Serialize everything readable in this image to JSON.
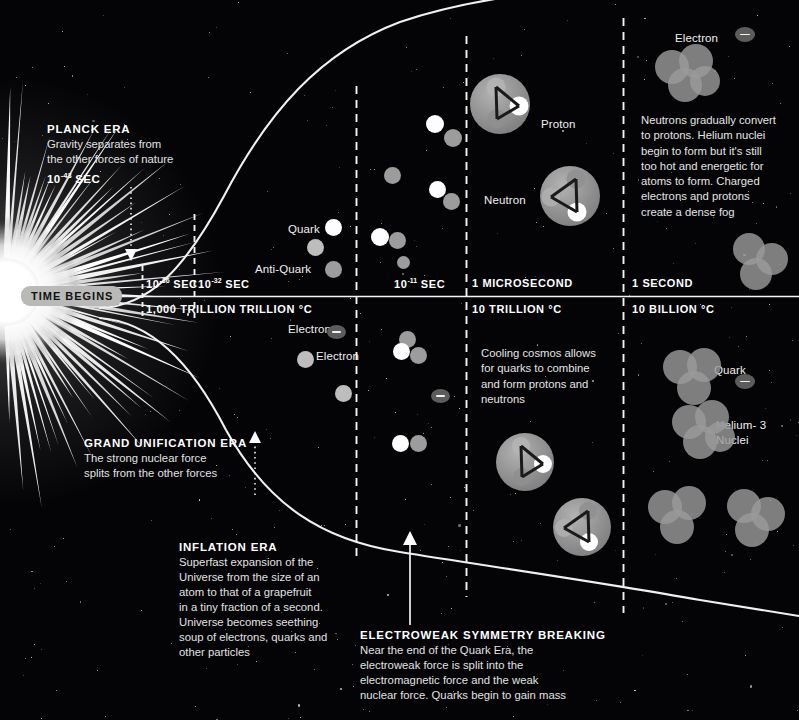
{
  "origin_label": "TIME BEGINS",
  "axis": {
    "time_ticks": [
      {
        "label": "10",
        "exponent": "-36",
        "unit": "SEC",
        "x": 146
      },
      {
        "label": "10",
        "exponent": "-32",
        "unit": "SEC",
        "x": 198
      },
      {
        "label": "10",
        "exponent": "-11",
        "unit": "SEC",
        "x": 394
      },
      {
        "label": "1",
        "exponent": "",
        "unit": "MICROSECOND",
        "x": 472
      },
      {
        "label": "1",
        "exponent": "",
        "unit": "SECOND",
        "x": 632
      }
    ],
    "temp_ticks": [
      {
        "label": "1,000 TRILLION TRILLION °C",
        "x": 146
      },
      {
        "label": "10 TRILLION °C",
        "x": 472
      },
      {
        "label": "10 BILLION °C",
        "x": 632
      }
    ]
  },
  "callouts": [
    {
      "id": "planck",
      "heading": "PLANCK ERA",
      "body": "Gravity separates from\nthe other forces of nature",
      "sub_base": "10",
      "sub_exp": "-43",
      "sub_unit": "SEC"
    },
    {
      "id": "grand-unification",
      "heading": "GRAND UNIFICATION ERA",
      "body": "The strong nuclear force\nsplits from the other forces"
    },
    {
      "id": "inflation",
      "heading": "INFLATION ERA",
      "body": "Superfast expansion of the\nUniverse from the size of an\natom to that of a grapefruit\nin a tiny fraction of a second.\nUniverse becomes seething\nsoup of electrons, quarks and\nother particles"
    },
    {
      "id": "electroweak",
      "heading": "ELECTROWEAK SYMMETRY BREAKING",
      "body": "Near the end of the Quark Era, the\nelectroweak force is split into the\nelectromagnetic force and the weak\nnuclear force. Quarks begin to gain mass"
    }
  ],
  "notes": [
    {
      "id": "neutron-conversion",
      "text": "Neutrons gradually convert\nto protons. Helium nuclei\nbegin to form but it's still\ntoo hot and energetic for\natoms to form. Charged\nelectrons  and protons\ncreate a dense fog"
    },
    {
      "id": "cooling-cosmos",
      "text": "Cooling cosmos allows\nfor quarks to combine\nand form protons and\nneutrons"
    }
  ],
  "particle_labels": [
    {
      "id": "quark-upper",
      "text": "Quark"
    },
    {
      "id": "anti-quark-upper",
      "text": "Anti-Quark"
    },
    {
      "id": "proton",
      "text": "Proton"
    },
    {
      "id": "neutron",
      "text": "Neutron"
    },
    {
      "id": "electron-upper",
      "text": "Electron"
    },
    {
      "id": "electron-lower",
      "text": "Electron"
    },
    {
      "id": "quark-lower",
      "text": "Quark"
    },
    {
      "id": "helium-3",
      "text": "Helium- 3\nNuclei"
    },
    {
      "id": "helium-4",
      "text": "Helium- 4\nNuclei"
    }
  ],
  "colors": {
    "background": "#040406",
    "curve": "#f0f0f0",
    "axis": "#f4f4f4",
    "pill_bg": "#b9b9b7",
    "quark_white": "#fdfdfd",
    "quark_gray": "#9c9c9c",
    "electron": "#5c5c5c",
    "nucleon": "#9a9a9a"
  }
}
